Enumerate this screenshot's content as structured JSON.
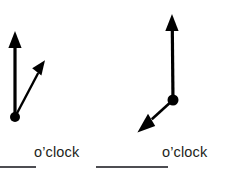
{
  "page": {
    "type": "worksheet-clock-hands-problem",
    "background_color": "#ffffff",
    "ink_color": "#000000",
    "text_color": "#231f20",
    "rule_color": "#4d4d52"
  },
  "problems": [
    {
      "id": "problem-1",
      "label_text": "o’clock",
      "answer_value": "",
      "clock": {
        "pivot": {
          "x": 15,
          "y": 117
        },
        "hands": [
          {
            "name": "hour-hand",
            "tip": {
              "x": 15,
              "y": 33
            },
            "direction": "up",
            "clock_position": "12",
            "stroke_width": 3.2,
            "arrowhead": "solid-triangle"
          },
          {
            "name": "minute-hand",
            "tip": {
              "x": 44,
              "y": 62
            },
            "direction": "up-right",
            "clock_position": "1",
            "stroke_width": 2.4,
            "arrowhead": "solid-triangle"
          }
        ],
        "pivot_dot_radius": 5
      }
    },
    {
      "id": "problem-2",
      "label_text": "o’clock",
      "answer_value": "",
      "clock": {
        "pivot": {
          "x": 173,
          "y": 100
        },
        "hands": [
          {
            "name": "hour-hand",
            "tip": {
              "x": 172,
              "y": 16
            },
            "direction": "up",
            "clock_position": "12",
            "stroke_width": 3.2,
            "arrowhead": "solid-triangle"
          },
          {
            "name": "minute-hand",
            "tip": {
              "x": 139,
              "y": 131
            },
            "direction": "down-left",
            "clock_position": "8",
            "stroke_width": 2.6,
            "arrowhead": "solid-triangle"
          }
        ],
        "pivot_dot_radius": 5.5
      }
    }
  ]
}
